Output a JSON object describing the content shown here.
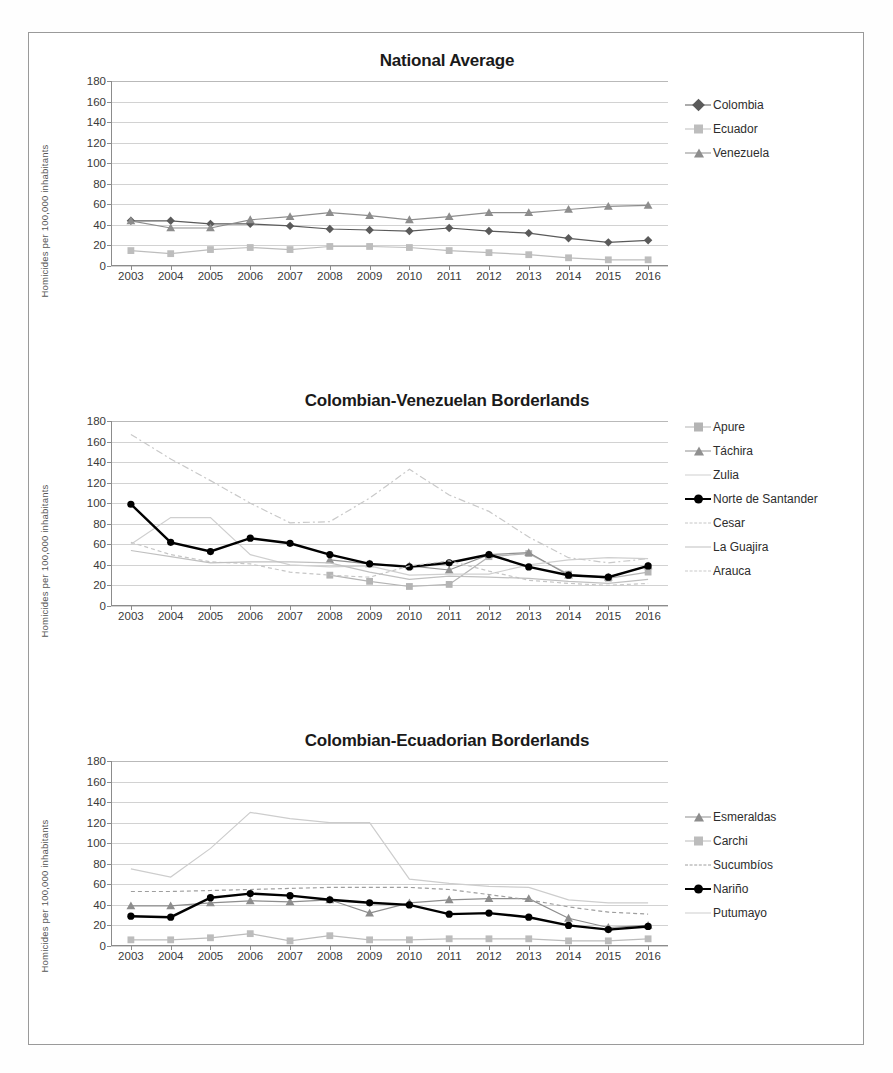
{
  "figure": {
    "y_axis_label": "Homicides per 100,000 inhabitants",
    "years": [
      "2003",
      "2004",
      "2005",
      "2006",
      "2007",
      "2008",
      "2009",
      "2010",
      "2011",
      "2012",
      "2013",
      "2014",
      "2015",
      "2016"
    ],
    "y_ticks": [
      "0",
      "20",
      "40",
      "60",
      "80",
      "100",
      "120",
      "140",
      "160",
      "180"
    ]
  },
  "colors": {
    "colombia": "#5a5a5a",
    "ecuador": "#bdbdbd",
    "venezuela": "#8d8d8d",
    "apure": "#b4b4b4",
    "tachira": "#909090",
    "zulia": "#cfcfcf",
    "norte_de_santander": "#000000",
    "cesar": "#c6c6c6",
    "la_guajira": "#c0c0c0",
    "arauca": "#c9c9c9",
    "esmeraldas": "#8d8d8d",
    "carchi": "#bcbcbc",
    "sucumbios": "#9e9e9e",
    "narino": "#000000",
    "putumayo": "#cdcdcd",
    "grid": "#d2d2d2",
    "axis": "#8c8c8c",
    "frame": "#9a9a9a"
  },
  "chart_data": [
    {
      "id": "national-average",
      "type": "line",
      "title": "National Average",
      "xlabel": "",
      "ylabel": "Homicides per 100,000 inhabitants",
      "categories": [
        "2003",
        "2004",
        "2005",
        "2006",
        "2007",
        "2008",
        "2009",
        "2010",
        "2011",
        "2012",
        "2013",
        "2014",
        "2015",
        "2016"
      ],
      "ylim": [
        0,
        180
      ],
      "ytick_step": 20,
      "grid": true,
      "legend_position": "right",
      "series": [
        {
          "name": "Colombia",
          "marker": "diamond",
          "line": "solid",
          "values": [
            44,
            44,
            41,
            41,
            39,
            36,
            35,
            34,
            37,
            34,
            32,
            27,
            23,
            25
          ]
        },
        {
          "name": "Ecuador",
          "marker": "square",
          "line": "solid",
          "values": [
            15,
            12,
            16,
            18,
            16,
            19,
            19,
            18,
            15,
            13,
            11,
            8,
            6,
            6
          ]
        },
        {
          "name": "Venezuela",
          "marker": "triangle",
          "line": "solid",
          "values": [
            44,
            37,
            37,
            45,
            48,
            52,
            49,
            45,
            48,
            52,
            52,
            55,
            58,
            59
          ]
        }
      ]
    },
    {
      "id": "colombian-venezuelan-borderlands",
      "type": "line",
      "title": "Colombian-Venezuelan Borderlands",
      "xlabel": "",
      "ylabel": "Homicides per 100,000 inhabitants",
      "categories": [
        "2003",
        "2004",
        "2005",
        "2006",
        "2007",
        "2008",
        "2009",
        "2010",
        "2011",
        "2012",
        "2013",
        "2014",
        "2015",
        "2016"
      ],
      "ylim": [
        0,
        180
      ],
      "ytick_step": 20,
      "grid": true,
      "legend_position": "right",
      "series": [
        {
          "name": "Apure",
          "marker": "square",
          "line": "solid",
          "values": [
            null,
            null,
            null,
            null,
            null,
            30,
            24,
            19,
            21,
            48,
            51,
            31,
            27,
            33
          ]
        },
        {
          "name": "Táchira",
          "marker": "triangle",
          "line": "solid",
          "values": [
            null,
            null,
            null,
            null,
            null,
            45,
            41,
            39,
            35,
            50,
            52,
            30,
            28,
            39
          ]
        },
        {
          "name": "Zulia",
          "marker": "none",
          "line": "solid",
          "values": [
            60,
            86,
            86,
            50,
            40,
            38,
            39,
            30,
            31,
            31,
            40,
            45,
            47,
            46
          ]
        },
        {
          "name": "Norte de Santander",
          "marker": "circle",
          "line": "bold",
          "values": [
            99,
            62,
            53,
            66,
            61,
            50,
            41,
            38,
            42,
            50,
            38,
            30,
            28,
            39
          ]
        },
        {
          "name": "Cesar",
          "marker": "none",
          "line": "dashed",
          "values": [
            62,
            50,
            43,
            41,
            33,
            30,
            28,
            39,
            44,
            34,
            25,
            22,
            20,
            22
          ]
        },
        {
          "name": "La Guajira",
          "marker": "none",
          "line": "solid",
          "values": [
            54,
            48,
            42,
            43,
            43,
            42,
            33,
            26,
            29,
            28,
            27,
            24,
            22,
            26
          ]
        },
        {
          "name": "Arauca",
          "marker": "none",
          "line": "dashdot",
          "values": [
            167,
            143,
            122,
            100,
            81,
            82,
            105,
            133,
            108,
            92,
            67,
            47,
            42,
            46
          ]
        }
      ]
    },
    {
      "id": "colombian-ecuadorian-borderlands",
      "type": "line",
      "title": "Colombian-Ecuadorian Borderlands",
      "xlabel": "",
      "ylabel": "Homicides per 100,000 inhabitants",
      "categories": [
        "2003",
        "2004",
        "2005",
        "2006",
        "2007",
        "2008",
        "2009",
        "2010",
        "2011",
        "2012",
        "2013",
        "2014",
        "2015",
        "2016"
      ],
      "ylim": [
        0,
        180
      ],
      "ytick_step": 20,
      "grid": true,
      "legend_position": "right",
      "series": [
        {
          "name": "Esmeraldas",
          "marker": "triangle",
          "line": "solid",
          "values": [
            39,
            39,
            42,
            44,
            43,
            45,
            32,
            42,
            45,
            46,
            46,
            27,
            18,
            20
          ]
        },
        {
          "name": "Carchi",
          "marker": "square",
          "line": "solid",
          "values": [
            6,
            6,
            8,
            12,
            5,
            10,
            6,
            6,
            7,
            7,
            7,
            5,
            5,
            7
          ]
        },
        {
          "name": "Sucumbíos",
          "marker": "none",
          "line": "dashed",
          "values": [
            53,
            53,
            54,
            55,
            56,
            57,
            57,
            57,
            55,
            50,
            45,
            38,
            33,
            31
          ]
        },
        {
          "name": "Nariño",
          "marker": "circle",
          "line": "bold",
          "values": [
            29,
            28,
            47,
            51,
            49,
            45,
            42,
            40,
            31,
            32,
            28,
            20,
            16,
            19
          ]
        },
        {
          "name": "Putumayo",
          "marker": "none",
          "line": "solid",
          "values": [
            75,
            67,
            95,
            130,
            124,
            120,
            120,
            65,
            61,
            58,
            57,
            45,
            42,
            42
          ]
        }
      ]
    }
  ],
  "legends": [
    {
      "chart": "national-average",
      "items": [
        {
          "label": "Colombia",
          "marker": "diamond",
          "color": "#5a5a5a",
          "line": "solid"
        },
        {
          "label": "Ecuador",
          "marker": "square",
          "color": "#bdbdbd",
          "line": "solid"
        },
        {
          "label": "Venezuela",
          "marker": "triangle",
          "color": "#8d8d8d",
          "line": "solid"
        }
      ]
    },
    {
      "chart": "colombian-venezuelan-borderlands",
      "items": [
        {
          "label": "Apure",
          "marker": "square",
          "color": "#b4b4b4",
          "line": "solid"
        },
        {
          "label": "Táchira",
          "marker": "triangle",
          "color": "#909090",
          "line": "solid"
        },
        {
          "label": "Zulia",
          "marker": "none",
          "color": "#cfcfcf",
          "line": "solid"
        },
        {
          "label": "Norte de Santander",
          "marker": "circle",
          "color": "#000000",
          "line": "bold"
        },
        {
          "label": "Cesar",
          "marker": "none",
          "color": "#c6c6c6",
          "line": "dashed"
        },
        {
          "label": "La Guajira",
          "marker": "none",
          "color": "#c0c0c0",
          "line": "solid"
        },
        {
          "label": "Arauca",
          "marker": "none",
          "color": "#c9c9c9",
          "line": "dashdot"
        }
      ]
    },
    {
      "chart": "colombian-ecuadorian-borderlands",
      "items": [
        {
          "label": "Esmeraldas",
          "marker": "triangle",
          "color": "#8d8d8d",
          "line": "solid"
        },
        {
          "label": "Carchi",
          "marker": "square",
          "color": "#bcbcbc",
          "line": "solid"
        },
        {
          "label": "Sucumbíos",
          "marker": "none",
          "color": "#9e9e9e",
          "line": "dashed"
        },
        {
          "label": "Nariño",
          "marker": "circle",
          "color": "#000000",
          "line": "bold"
        },
        {
          "label": "Putumayo",
          "marker": "none",
          "color": "#cdcdcd",
          "line": "solid"
        }
      ]
    }
  ]
}
